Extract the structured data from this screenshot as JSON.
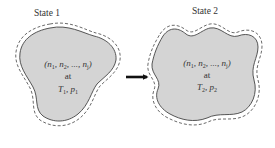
{
  "diagram": {
    "states": [
      {
        "title": "State 1",
        "composition": {
          "open": "(",
          "n1": "n",
          "n1_sub": "1",
          "sep1": ", ",
          "n2": "n",
          "n2_sub": "2",
          "sep2": ", ..., ",
          "nj": "n",
          "nj_sub": "j",
          "close": ")"
        },
        "at": "at",
        "conditions": {
          "T": "T",
          "T_sub": "1",
          "sep": ", ",
          "p": "p",
          "p_sub": "1"
        }
      },
      {
        "title": "State 2",
        "composition": {
          "open": "(",
          "n1": "n",
          "n1_sub": "1",
          "sep1": ", ",
          "n2": "n",
          "n2_sub": "2",
          "sep2": ", ..., ",
          "nj": "n",
          "nj_sub": "j",
          "close": ")"
        },
        "at": "at",
        "conditions": {
          "T": "T",
          "T_sub": "2",
          "sep": ", ",
          "p": "p",
          "p_sub": "2"
        }
      }
    ],
    "colors": {
      "region_fill": "#d4d4d4",
      "outline": "#444444",
      "arrow": "#111111",
      "text": "#333333"
    }
  }
}
